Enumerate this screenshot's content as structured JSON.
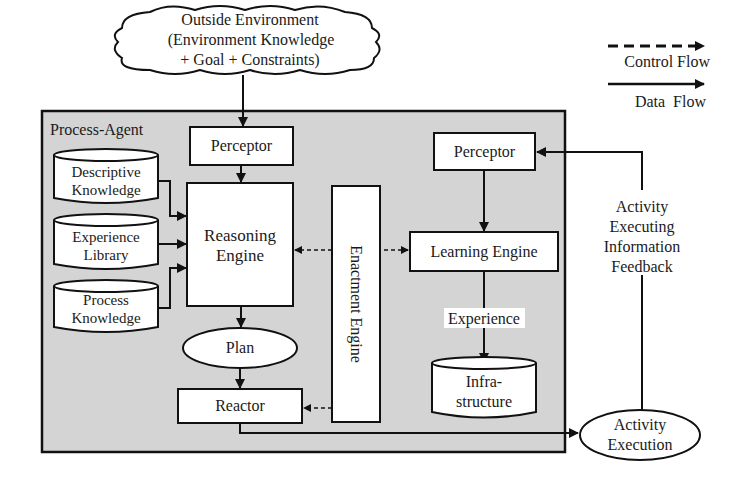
{
  "diagram": {
    "outside_environment": {
      "line1": "Outside Environment",
      "line2": "(Environment Knowledge",
      "line3": "+ Goal + Constraints)"
    },
    "legend": {
      "control_flow": "Control Flow",
      "data_flow": "Data Flow"
    },
    "process_agent": {
      "title": "Process-Agent",
      "perceptor_left": "Perceptor",
      "reasoning_engine": {
        "line1": "Reasoning",
        "line2": "Engine"
      },
      "knowledge_stores": [
        {
          "line1": "Descriptive",
          "line2": "Knowledge"
        },
        {
          "line1": "Experience",
          "line2": "Library"
        },
        {
          "line1": "Process",
          "line2": "Knowledge"
        }
      ],
      "plan": "Plan",
      "reactor": "Reactor",
      "enactment_engine": "Enactment Engine",
      "perceptor_right": "Perceptor",
      "learning_engine": "Learning Engine",
      "experience_label": "Experience",
      "infrastructure": {
        "line1": "Infra-",
        "line2": "structure"
      }
    },
    "feedback_label": {
      "line1": "Activity",
      "line2": "Executing",
      "line3": "Information",
      "line4": "Feedback"
    },
    "activity_execution": {
      "line1": "Activity",
      "line2": "Execution"
    },
    "colors": {
      "agent_fill": "#d4d4d4",
      "box_fill": "#ffffff",
      "stroke": "#111111"
    }
  }
}
